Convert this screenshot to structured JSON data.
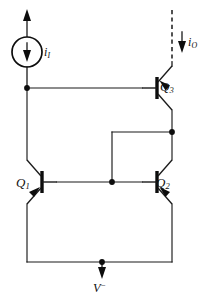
{
  "figure": {
    "width": 209,
    "height": 303,
    "background": "#ffffff",
    "ink_color": "#1a1a1a"
  },
  "labels": {
    "q1": {
      "name": "Q",
      "subscript": "1"
    },
    "q2": {
      "name": "Q",
      "subscript": "2"
    },
    "q3": {
      "name": "Q",
      "subscript": "3"
    },
    "input_current": {
      "name": "i",
      "subscript": "I"
    },
    "output_current": {
      "name": "i",
      "subscript": "O"
    },
    "negative_supply": {
      "name": "V",
      "superscript": "−"
    }
  },
  "components": [
    {
      "id": "current-source",
      "type": "current-source",
      "label": "i_I",
      "shape": "circle",
      "internal_arrow_direction": "down",
      "terminal_arrow_direction": "up",
      "center_x": 27,
      "center_y": 52,
      "radius": 15
    },
    {
      "id": "q1",
      "type": "transistor",
      "polarity": "PNP",
      "label": "Q_1",
      "orientation": "base-right",
      "x": 40,
      "y": 182
    },
    {
      "id": "q2",
      "type": "transistor",
      "polarity": "PNP",
      "label": "Q_2",
      "orientation": "base-left",
      "x": 170,
      "y": 182
    },
    {
      "id": "q3",
      "type": "transistor",
      "polarity": "PNP",
      "label": "Q_3",
      "orientation": "base-left",
      "x": 170,
      "y": 88
    },
    {
      "id": "output-terminal",
      "type": "dashed-output-lead",
      "label": "i_O",
      "arrow_direction": "down",
      "x": 172,
      "y_top": 10,
      "y_bottom": 66
    },
    {
      "id": "negative-rail",
      "type": "supply-rail",
      "label": "V-",
      "arrow_direction": "down",
      "x": 102,
      "y_top": 262,
      "y_bottom": 278
    }
  ],
  "nodes": [
    {
      "id": "node-input",
      "x": 27,
      "y": 88
    },
    {
      "id": "node-right-mid",
      "x": 172,
      "y": 132
    },
    {
      "id": "node-base-mid",
      "x": 112,
      "y": 182
    },
    {
      "id": "node-bottom",
      "x": 102,
      "y": 262
    }
  ],
  "nets": [
    {
      "id": "net-input-to-q3-base",
      "from": "node-input",
      "to": "q3-base",
      "y": 88
    },
    {
      "id": "net-q3-emitter-to-node",
      "from": "q3-emitter",
      "to": "node-right-mid"
    },
    {
      "id": "net-node-to-q2-collector",
      "from": "node-right-mid",
      "to": "q2-collector"
    },
    {
      "id": "net-q1-base-to-q2-base",
      "from": "q1-base",
      "to": "q2-base",
      "y": 182
    },
    {
      "id": "net-base-mid-to-top",
      "from": "node-base-mid",
      "to": "y132"
    },
    {
      "id": "net-q1-emitter-to-input",
      "from": "q1-emitter",
      "to": "node-input"
    },
    {
      "id": "net-bottom-rail",
      "from": "q1-collector",
      "to": "q2-emitter",
      "y": 262
    }
  ]
}
